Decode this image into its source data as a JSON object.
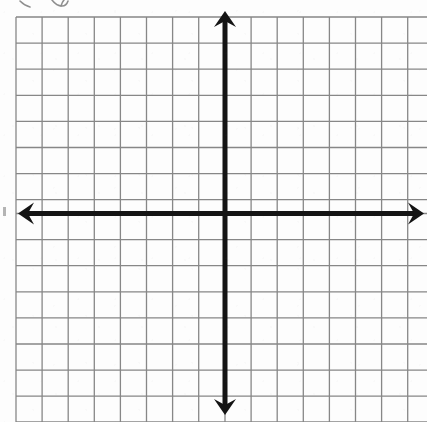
{
  "document": {
    "kind": "worksheet-graphic",
    "title": "Blank coordinate plane",
    "description": "Scanned blank Cartesian coordinate grid with arrowed x and y axes",
    "alt_text": "Empty four-quadrant graph paper grid with bold x-axis and y-axis arrows crossing at the origin"
  },
  "canvas": {
    "width": 427,
    "height": 422,
    "background_color": "#ffffff"
  },
  "grid": {
    "line_color": "#7d7d7d",
    "line_width": 1.3,
    "cell_size": 26.1,
    "origin_x": 225,
    "origin_y": 213.5,
    "left_edge": 16,
    "top_edge": 17,
    "right_edge": 427,
    "bottom_edge": 422,
    "columns": 16,
    "rows": 16,
    "vertical_line_positions": [
      16.0,
      42.1,
      68.2,
      94.3,
      120.4,
      146.5,
      172.6,
      198.7,
      225.0,
      251.1,
      277.2,
      303.3,
      329.4,
      355.5,
      381.6,
      407.7
    ],
    "horizontal_line_positions": [
      17.0,
      43.1,
      69.2,
      95.3,
      121.4,
      147.5,
      173.6,
      199.7,
      213.5,
      239.6,
      265.7,
      291.8,
      317.9,
      344.0,
      370.1,
      396.2,
      422.0
    ]
  },
  "axes": {
    "color": "#141414",
    "stroke_width": 5,
    "arrowhead_length": 16,
    "arrowhead_half_width": 11,
    "x_axis": {
      "label": "x-axis",
      "y": 213.5,
      "x_start": 18,
      "x_end": 424,
      "arrow_start": true,
      "arrow_end": true,
      "tick_labels": [],
      "axis_title": ""
    },
    "y_axis": {
      "label": "y-axis",
      "x": 225,
      "y_start": 11,
      "y_end": 415,
      "arrow_start": true,
      "arrow_end": true,
      "tick_labels": [],
      "axis_title": ""
    },
    "origin_label": ""
  },
  "annotations": {
    "top_handwriting": {
      "present": true,
      "description": "bottom tips of two handwritten characters clipped by the top edge of the scan",
      "color": "#5a5a5a"
    },
    "left_speck": {
      "present": true,
      "description": "faint scan speck at far-left edge beside the x-axis arrow",
      "color": "#5a5a5a"
    }
  },
  "chart_data": {
    "type": "scatter",
    "title": "",
    "subtitle": "",
    "xlabel": "",
    "ylabel": "",
    "xlim": [
      -8,
      8
    ],
    "ylim": [
      -8,
      8
    ],
    "xticks": [
      -8,
      -7,
      -6,
      -5,
      -4,
      -3,
      -2,
      -1,
      0,
      1,
      2,
      3,
      4,
      5,
      6,
      7,
      8
    ],
    "yticks": [
      -8,
      -7,
      -6,
      -5,
      -4,
      -3,
      -2,
      -1,
      0,
      1,
      2,
      3,
      4,
      5,
      6,
      7,
      8
    ],
    "xtick_labels": [],
    "ytick_labels": [],
    "grid": true,
    "legend": false,
    "legend_position": "none",
    "annotations": [],
    "series": [
      {
        "name": "",
        "x": [],
        "y": []
      }
    ],
    "note": "Blank template grid — no data points, curves, labels or legend are plotted."
  }
}
